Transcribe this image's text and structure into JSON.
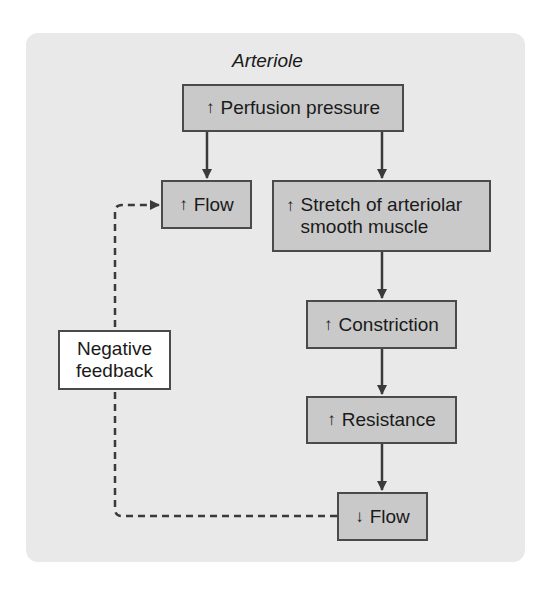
{
  "diagram": {
    "title": "Arteriole",
    "nodes": [
      {
        "id": "perfusion",
        "direction": "up",
        "arrow_glyph": "↑",
        "label": "Perfusion pressure"
      },
      {
        "id": "flow_up",
        "direction": "up",
        "arrow_glyph": "↑",
        "label": "Flow"
      },
      {
        "id": "stretch",
        "direction": "up",
        "arrow_glyph": "↑",
        "label_line1": "Stretch of arteriolar",
        "label_line2": "smooth muscle"
      },
      {
        "id": "constriction",
        "direction": "up",
        "arrow_glyph": "↑",
        "label": "Constriction"
      },
      {
        "id": "resistance",
        "direction": "up",
        "arrow_glyph": "↑",
        "label": "Resistance"
      },
      {
        "id": "flow_down",
        "direction": "down",
        "arrow_glyph": "↓",
        "label": "Flow"
      },
      {
        "id": "neg_feedback",
        "label_line1": "Negative",
        "label_line2": "feedback"
      }
    ],
    "edges": [
      {
        "from": "perfusion",
        "to": "flow_up",
        "style": "solid"
      },
      {
        "from": "perfusion",
        "to": "stretch",
        "style": "solid"
      },
      {
        "from": "stretch",
        "to": "constriction",
        "style": "solid"
      },
      {
        "from": "constriction",
        "to": "resistance",
        "style": "solid"
      },
      {
        "from": "resistance",
        "to": "flow_down",
        "style": "solid"
      },
      {
        "from": "flow_down",
        "to": "flow_up",
        "style": "dashed",
        "via": "neg_feedback"
      }
    ],
    "colors": {
      "panel": "#e9e9e9",
      "box_fill": "#c9c9c9",
      "box_border": "#4a4a4a",
      "feedback_fill": "#ffffff",
      "line": "#3a3a3a"
    }
  }
}
